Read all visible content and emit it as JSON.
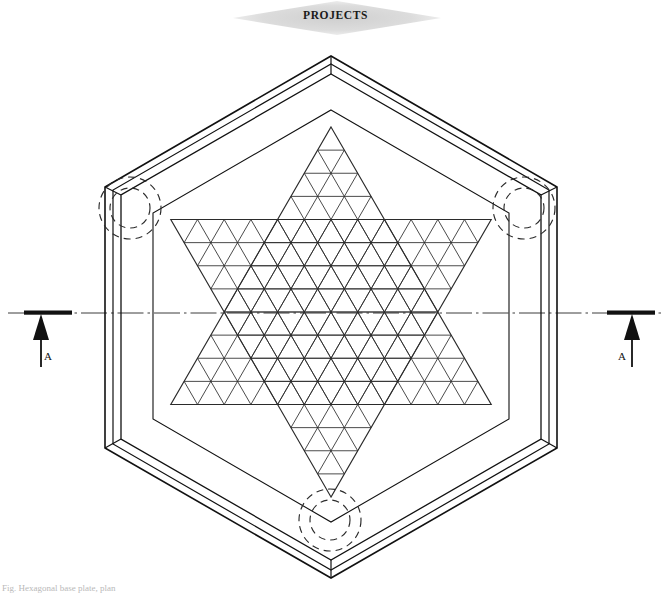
{
  "document": {
    "title": "PROJECTS",
    "drawing_type": "engineering-plan-view",
    "footnote": "Fig. Hexagonal base plate, plan"
  },
  "banner": {
    "label": "PROJECTS",
    "shape": "diamond",
    "fill_color": "#d9d9d9",
    "text_color": "#1a1a1a",
    "center_x": 337,
    "center_y": 18,
    "half_width": 104,
    "half_height": 17
  },
  "section_markers": [
    {
      "name": "section-marker-left",
      "label": "A",
      "bar_x1": 24,
      "bar_x2": 72,
      "bar_y": 313,
      "stem_x": 41,
      "stem_y1": 316,
      "stem_y2": 367,
      "arrow_direction": "up",
      "label_x": 44,
      "label_y": 350
    },
    {
      "name": "section-marker-right",
      "label": "A",
      "bar_x1": 607,
      "bar_x2": 655,
      "bar_y": 313,
      "stem_x": 632,
      "stem_y1": 316,
      "stem_y2": 367,
      "arrow_direction": "up",
      "label_x": 618,
      "label_y": 350
    }
  ],
  "centerline": {
    "name": "horizontal-axis-centerline",
    "y": 313,
    "x1": 8,
    "x2": 663,
    "style": "dash-dot",
    "color": "#3c3c3c"
  },
  "frame": {
    "name": "hexagonal-frame",
    "center_x": 331,
    "center_y": 317,
    "outer_radius": 261,
    "mid_radius": 252,
    "inner_radius": 243,
    "cavity_radius": 205,
    "orientation": "pointy-top",
    "line_color": "#111111",
    "line_width": 1.4
  },
  "star": {
    "name": "hexagram-truss-mesh",
    "center_x": 331,
    "center_y": 312,
    "circumradius": 185,
    "grid_divisions": 12,
    "line_color": "#2b2b2b",
    "line_width": 0.9,
    "description": "Star of David formed by two overlapping equilateral triangles, infilled with an isometric triangular grid"
  },
  "detail_circles": [
    {
      "name": "detail-circle-upper-left",
      "cx": 130,
      "cy": 208,
      "r_outer": 31,
      "r_inner": 20
    },
    {
      "name": "detail-circle-upper-right",
      "cx": 524,
      "cy": 208,
      "r_outer": 31,
      "r_inner": 20
    },
    {
      "name": "detail-circle-bottom",
      "cx": 330,
      "cy": 520,
      "r_outer": 31,
      "r_inner": 20
    }
  ],
  "colors": {
    "ink": "#111111",
    "mesh": "#2b2b2b",
    "banner_fill": "#d9d9d9",
    "background": "#ffffff"
  }
}
